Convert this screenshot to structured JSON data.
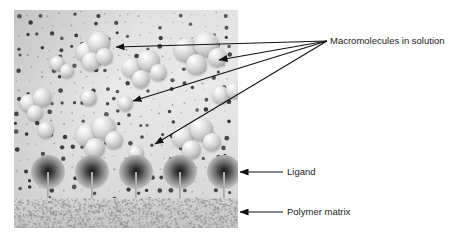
{
  "figure": {
    "type": "affinity-chromatography-schematic",
    "background_color": "#ffffff"
  },
  "panel": {
    "name": "illustration-panel",
    "x": 14,
    "y": 10,
    "width": 224,
    "height": 218,
    "background_colors": [
      "#e2e2e2",
      "#e9e9e9",
      "#d2d2d2"
    ],
    "solvent_dot_color": "#2a2a2a"
  },
  "labels": {
    "macromolecules": "Macromolecules in solution",
    "ligand": "Ligand",
    "polymer_matrix": "Polymer matrix"
  },
  "annotation_color": "#111111",
  "callouts": [
    {
      "label_key": "macromolecules",
      "anchor_x": 327,
      "anchor_y": 41,
      "tip_x": 116,
      "tip_y": 47
    },
    {
      "label_key": "macromolecules",
      "anchor_x": 327,
      "anchor_y": 41,
      "tip_x": 219,
      "tip_y": 60
    },
    {
      "label_key": "macromolecules",
      "anchor_x": 327,
      "anchor_y": 41,
      "tip_x": 133,
      "tip_y": 101
    },
    {
      "label_key": "macromolecules",
      "anchor_x": 327,
      "anchor_y": 41,
      "tip_x": 155,
      "tip_y": 144
    },
    {
      "label_key": "ligand",
      "anchor_x": 283,
      "anchor_y": 172,
      "tip_x": 240,
      "tip_y": 172
    },
    {
      "label_key": "polymer_matrix",
      "anchor_x": 283,
      "anchor_y": 212,
      "tip_x": 240,
      "tip_y": 212
    }
  ],
  "macromolecules": [
    {
      "x": 62,
      "y": 22,
      "spheres": [
        [
          0,
          10,
          20
        ],
        [
          12,
          0,
          22
        ],
        [
          6,
          20,
          19
        ],
        [
          20,
          16,
          17
        ]
      ]
    },
    {
      "x": 36,
      "y": 44,
      "spheres": [
        [
          0,
          2,
          15
        ],
        [
          10,
          10,
          14
        ]
      ]
    },
    {
      "x": 108,
      "y": 40,
      "spheres": [
        [
          0,
          8,
          20
        ],
        [
          16,
          0,
          22
        ],
        [
          10,
          20,
          18
        ],
        [
          28,
          14,
          17
        ]
      ]
    },
    {
      "x": 160,
      "y": 22,
      "spheres": [
        [
          0,
          6,
          24
        ],
        [
          20,
          0,
          25
        ],
        [
          12,
          22,
          21
        ],
        [
          34,
          16,
          19
        ]
      ]
    },
    {
      "x": 6,
      "y": 78,
      "spheres": [
        [
          0,
          6,
          18
        ],
        [
          13,
          0,
          19
        ],
        [
          7,
          17,
          16
        ]
      ]
    },
    {
      "x": 67,
      "y": 80,
      "spheres": [
        [
          0,
          0,
          16
        ]
      ]
    },
    {
      "x": 104,
      "y": 86,
      "spheres": [
        [
          0,
          0,
          15
        ]
      ]
    },
    {
      "x": 24,
      "y": 112,
      "spheres": [
        [
          0,
          0,
          16
        ]
      ]
    },
    {
      "x": 62,
      "y": 106,
      "spheres": [
        [
          0,
          8,
          22
        ],
        [
          16,
          0,
          24
        ],
        [
          9,
          22,
          20
        ],
        [
          29,
          15,
          18
        ]
      ]
    },
    {
      "x": 115,
      "y": 136,
      "spheres": [
        [
          0,
          0,
          15
        ]
      ]
    },
    {
      "x": 158,
      "y": 108,
      "spheres": [
        [
          0,
          8,
          22
        ],
        [
          18,
          0,
          23
        ],
        [
          10,
          22,
          19
        ],
        [
          31,
          15,
          18
        ]
      ]
    },
    {
      "x": 198,
      "y": 72,
      "spheres": [
        [
          0,
          4,
          18
        ],
        [
          14,
          0,
          17
        ]
      ]
    }
  ],
  "ligands": [
    {
      "cx": 34,
      "head_y": 162,
      "stalk_bottom": 200
    },
    {
      "cx": 78,
      "head_y": 162,
      "stalk_bottom": 200
    },
    {
      "cx": 122,
      "head_y": 162,
      "stalk_bottom": 200
    },
    {
      "cx": 166,
      "head_y": 162,
      "stalk_bottom": 200
    },
    {
      "cx": 210,
      "head_y": 162,
      "stalk_bottom": 200
    }
  ],
  "matrix": {
    "name": "polymer-matrix-band",
    "height": 30,
    "color": "#cdcdcd",
    "speckle_color": "#8a8a8a"
  }
}
